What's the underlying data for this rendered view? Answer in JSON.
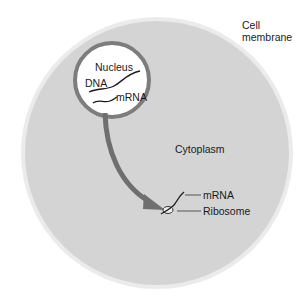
{
  "diagram": {
    "labels": {
      "cell_membrane_line1": "Cell",
      "cell_membrane_line2": "membrane",
      "nucleus": "Nucleus",
      "dna": "DNA",
      "mrna_nucleus": "mRNA",
      "cytoplasm": "Cytoplasm",
      "mrna_cytoplasm": "mRNA",
      "ribosome": "Ribosome"
    },
    "colors": {
      "cytoplasm_fill": "#d4d4d4",
      "membrane": "#f4f4f4",
      "nucleus_fill": "#ffffff",
      "nucleus_border": "#7d7d7d",
      "arrow": "#6f6f6f",
      "strand": "#1a1a1a"
    }
  }
}
